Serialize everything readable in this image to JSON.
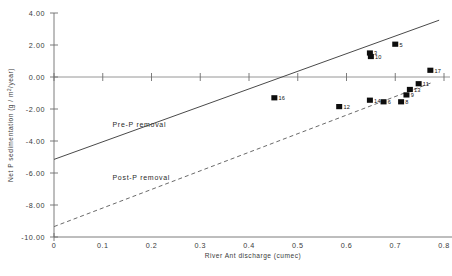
{
  "chart_data": {
    "type": "scatter",
    "title": "",
    "xlabel": "River Ant discharge (cumec)",
    "ylabel": "Net P sedimentation (g / m2/year)",
    "xlim": [
      0,
      0.8
    ],
    "ylim": [
      -10.0,
      4.0
    ],
    "grid": false,
    "legend_position": "inline-annotations",
    "xticks": [
      "0",
      "0.1",
      "0.2",
      "0.3",
      "0.4",
      "0.5",
      "0.6",
      "0.7",
      "0.8"
    ],
    "xtick_values": [
      0,
      0.1,
      0.2,
      0.3,
      0.4,
      0.5,
      0.6,
      0.7,
      0.8
    ],
    "yticks": [
      "4.00",
      "2.00",
      "0.00",
      "-2.00",
      "-4.00",
      "-6.00",
      "-8.00",
      "-10.00"
    ],
    "ytick_values": [
      4,
      2,
      0,
      -2,
      -4,
      -6,
      -8,
      -10
    ],
    "points": [
      {
        "label": "16",
        "x": 0.452,
        "y": -1.3
      },
      {
        "label": "3",
        "x": 0.648,
        "y": 1.5
      },
      {
        "label": "10",
        "x": 0.65,
        "y": 1.28
      },
      {
        "label": "5",
        "x": 0.7,
        "y": 2.05
      },
      {
        "label": "12",
        "x": 0.585,
        "y": -1.85
      },
      {
        "label": "14",
        "x": 0.648,
        "y": -1.45
      },
      {
        "label": "6",
        "x": 0.676,
        "y": -1.55
      },
      {
        "label": "8",
        "x": 0.712,
        "y": -1.55
      },
      {
        "label": "9",
        "x": 0.723,
        "y": -1.12
      },
      {
        "label": "13",
        "x": 0.73,
        "y": -0.78
      },
      {
        "label": "11",
        "x": 0.748,
        "y": -0.42
      },
      {
        "label": "17",
        "x": 0.772,
        "y": 0.42
      }
    ],
    "series": [
      {
        "name": "Pre-P removal",
        "style": "solid",
        "line": {
          "x0": 0.0,
          "y0": -5.15,
          "x1": 0.79,
          "y1": 3.55
        }
      },
      {
        "name": "Post-P removal",
        "style": "dashed",
        "line": {
          "x0": 0.0,
          "y0": -9.35,
          "x1": 0.775,
          "y1": -0.35
        }
      }
    ],
    "annotations": [
      {
        "text": "Pre-P removal",
        "x": 0.12,
        "y": -3.1
      },
      {
        "text": "Post-P removal",
        "x": 0.12,
        "y": -6.45
      }
    ]
  }
}
